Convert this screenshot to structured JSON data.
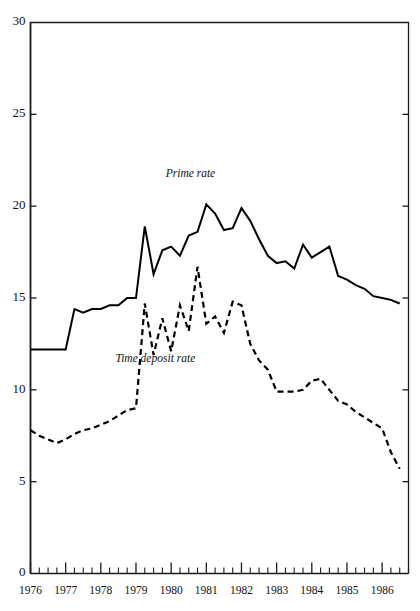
{
  "chart_data": {
    "type": "line",
    "title": "",
    "xlabel": "",
    "ylabel": "",
    "xlim": [
      1976.0,
      1986.75
    ],
    "ylim": [
      0,
      30
    ],
    "grid": false,
    "legend_position": "inline-annotation",
    "y_ticks": [
      0,
      5,
      10,
      15,
      20,
      25,
      30
    ],
    "y_tick_labels": [
      "0",
      "5",
      "10",
      "15",
      "20",
      "25",
      "30"
    ],
    "x_ticks": [
      1976,
      1977,
      1978,
      1979,
      1980,
      1981,
      1982,
      1983,
      1984,
      1985,
      1986
    ],
    "x_tick_labels": [
      "1976",
      "1977",
      "1978",
      "1979",
      "1980",
      "1981",
      "1982",
      "1983",
      "1984",
      "1985",
      "1986"
    ],
    "x_minor_ticks_per_year": 4,
    "annotations": [
      {
        "name": "prime-rate-label",
        "text": "Prime rate",
        "x": 1980.55,
        "y": 21.6
      },
      {
        "name": "time-deposit-rate-label",
        "text": "Time deposit rate",
        "x": 1979.55,
        "y": 11.5
      }
    ],
    "series": [
      {
        "name": "Prime rate",
        "style": "solid",
        "x": [
          1976.0,
          1976.25,
          1976.5,
          1976.75,
          1977.0,
          1977.25,
          1977.5,
          1977.75,
          1978.0,
          1978.25,
          1978.5,
          1978.75,
          1979.0,
          1979.25,
          1979.5,
          1979.75,
          1980.0,
          1980.25,
          1980.5,
          1980.75,
          1981.0,
          1981.25,
          1981.5,
          1981.75,
          1982.0,
          1982.25,
          1982.5,
          1982.75,
          1983.0,
          1983.25,
          1983.5,
          1983.75,
          1984.0,
          1984.25,
          1984.5,
          1984.75,
          1985.0,
          1985.25,
          1985.5,
          1985.75,
          1986.0,
          1986.25,
          1986.5
        ],
        "values": [
          12.2,
          12.2,
          12.2,
          12.2,
          12.2,
          14.4,
          14.2,
          14.4,
          14.4,
          14.6,
          14.6,
          15.0,
          15.0,
          18.9,
          16.3,
          17.6,
          17.8,
          17.3,
          18.4,
          18.6,
          20.1,
          19.6,
          18.7,
          18.8,
          19.9,
          19.2,
          18.2,
          17.3,
          16.9,
          17.0,
          16.6,
          17.9,
          17.2,
          17.5,
          17.8,
          16.2,
          16.0,
          15.7,
          15.5,
          15.1,
          15.0,
          14.9,
          14.7
        ]
      },
      {
        "name": "Time deposit rate",
        "style": "dashed",
        "x": [
          1976.0,
          1976.25,
          1976.5,
          1976.75,
          1977.0,
          1977.25,
          1977.5,
          1977.75,
          1978.0,
          1978.25,
          1978.5,
          1978.75,
          1979.0,
          1979.25,
          1979.5,
          1979.75,
          1980.0,
          1980.25,
          1980.5,
          1980.75,
          1981.0,
          1981.25,
          1981.5,
          1981.75,
          1982.0,
          1982.25,
          1982.5,
          1982.75,
          1983.0,
          1983.25,
          1983.5,
          1983.75,
          1984.0,
          1984.25,
          1984.5,
          1984.75,
          1985.0,
          1985.25,
          1985.5,
          1985.75,
          1986.0,
          1986.25,
          1986.5
        ],
        "values": [
          7.8,
          7.5,
          7.3,
          7.1,
          7.3,
          7.6,
          7.8,
          7.9,
          8.1,
          8.3,
          8.6,
          8.9,
          9.0,
          14.7,
          11.9,
          13.9,
          12.1,
          14.6,
          13.2,
          16.7,
          13.6,
          14.0,
          13.1,
          14.8,
          14.6,
          12.5,
          11.6,
          11.1,
          9.9,
          9.9,
          9.9,
          10.0,
          10.5,
          10.6,
          10.0,
          9.4,
          9.2,
          8.8,
          8.5,
          8.2,
          7.9,
          6.6,
          5.7
        ]
      }
    ]
  }
}
